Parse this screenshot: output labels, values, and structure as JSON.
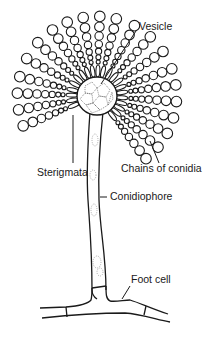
{
  "diagram": {
    "labels": {
      "vesicle": "Vesicle",
      "sterigmata": "Sterigmata",
      "chains_of_conidia": "Chains of conidia",
      "conidiophore": "Conidiophore",
      "foot_cell": "Foot cell"
    },
    "colors": {
      "line": "#1a1a1a",
      "background": "#ffffff",
      "dots": "#555555"
    }
  }
}
